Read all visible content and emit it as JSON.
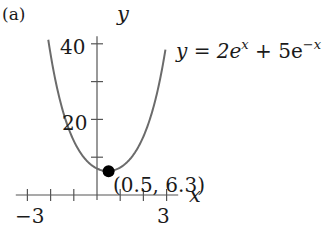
{
  "panel_label": "(a)",
  "chart_data": {
    "type": "line",
    "title": "",
    "xlabel": "x",
    "ylabel": "y",
    "xlim": [
      -3.5,
      3.5
    ],
    "ylim": [
      0,
      42
    ],
    "x_ticks": [
      -3,
      -2,
      -1,
      0,
      1,
      2,
      3
    ],
    "x_tick_labels": [
      {
        "value": -3,
        "label": "−3"
      },
      {
        "value": 3,
        "label": "3"
      }
    ],
    "y_ticks": [
      10,
      20,
      30,
      40
    ],
    "y_tick_labels": [
      {
        "value": 20,
        "label": "20"
      },
      {
        "value": 40,
        "label": "40"
      }
    ],
    "grid": false,
    "series": [
      {
        "name": "y = 2e^x + 5e^-x",
        "function": {
          "a": 2,
          "b": 5
        },
        "x_range": [
          -2.1,
          2.95
        ],
        "color": "#6b6b6b"
      }
    ],
    "annotations": [
      {
        "type": "point",
        "x": 0.5,
        "y": 6.3,
        "label": "(0.5, 6.3)",
        "color": "#000000"
      },
      {
        "type": "equation",
        "text": "y = 2e^x + 5e^-x"
      }
    ]
  },
  "equation": {
    "lhs": "y = 2e",
    "exp1": "x",
    "mid": " + 5e",
    "exp2": "−x"
  },
  "point_label": "(0.5, 6.3)",
  "axis_labels": {
    "x": "x",
    "y": "y"
  },
  "tick_labels": {
    "x_min": "−3",
    "x_max": "3",
    "y_mid": "20",
    "y_max": "40"
  },
  "style": {
    "curve_color": "#6b6b6b",
    "axis_color": "#555555",
    "point_color": "#000000"
  }
}
